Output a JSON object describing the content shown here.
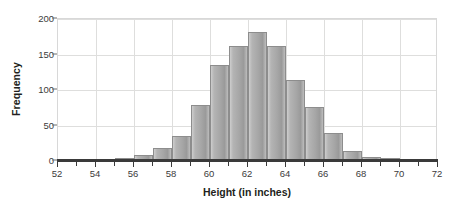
{
  "chart_data": {
    "type": "bar",
    "title": "",
    "subtitle": "",
    "xlabel": "Height (in inches)",
    "ylabel": "Frequency",
    "xlim": [
      52,
      72
    ],
    "ylim": [
      0,
      200
    ],
    "x_tick_labels": [
      "52",
      "54",
      "56",
      "58",
      "60",
      "62",
      "64",
      "66",
      "68",
      "70",
      "72"
    ],
    "x_tick_values": [
      52,
      54,
      56,
      58,
      60,
      62,
      64,
      66,
      68,
      70,
      72
    ],
    "x_minor_ticks": [
      53,
      55,
      57,
      59,
      61,
      63,
      65,
      67,
      69,
      71
    ],
    "y_tick_labels": [
      "0",
      "50",
      "100",
      "150",
      "200"
    ],
    "y_tick_values": [
      0,
      50,
      100,
      150,
      200
    ],
    "grid": true,
    "legend": null,
    "bin_width": 1,
    "bins": [
      {
        "left": 55,
        "right": 56,
        "value": 3
      },
      {
        "left": 56,
        "right": 57,
        "value": 7
      },
      {
        "left": 57,
        "right": 58,
        "value": 17
      },
      {
        "left": 58,
        "right": 59,
        "value": 34
      },
      {
        "left": 59,
        "right": 60,
        "value": 78
      },
      {
        "left": 60,
        "right": 61,
        "value": 134
      },
      {
        "left": 61,
        "right": 62,
        "value": 161
      },
      {
        "left": 62,
        "right": 63,
        "value": 180
      },
      {
        "left": 63,
        "right": 64,
        "value": 160
      },
      {
        "left": 64,
        "right": 65,
        "value": 113
      },
      {
        "left": 65,
        "right": 66,
        "value": 75
      },
      {
        "left": 66,
        "right": 67,
        "value": 38
      },
      {
        "left": 67,
        "right": 68,
        "value": 13
      },
      {
        "left": 68,
        "right": 69,
        "value": 4
      },
      {
        "left": 69,
        "right": 70,
        "value": 3
      },
      {
        "left": 70,
        "right": 71,
        "value": 1
      }
    ],
    "categories": [
      "55-56",
      "56-57",
      "57-58",
      "58-59",
      "59-60",
      "60-61",
      "61-62",
      "62-63",
      "63-64",
      "64-65",
      "65-66",
      "66-67",
      "67-68",
      "68-69",
      "69-70",
      "70-71"
    ],
    "values": [
      3,
      7,
      17,
      34,
      78,
      134,
      161,
      180,
      160,
      113,
      75,
      38,
      13,
      4,
      3,
      1
    ]
  },
  "colors": {
    "bar_fill": "#aaaaaa",
    "bar_edge": "#8d8d8d",
    "gridline": "#dededd",
    "axis_line": "#3a3a3a",
    "text": "#231f20",
    "tick_text": "#3b3b3b",
    "background": "#ffffff"
  }
}
